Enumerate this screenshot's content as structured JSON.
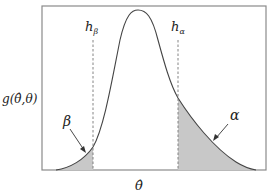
{
  "diagram": {
    "type": "probability-density-with-tail-regions",
    "y_axis_label": "g(θ̂,θ)",
    "x_axis_label": "θ̂",
    "thresholds": [
      {
        "name": "h_beta",
        "symbol": "h",
        "subscript": "β"
      },
      {
        "name": "h_alpha",
        "symbol": "h",
        "subscript": "α"
      }
    ],
    "regions": [
      {
        "name": "beta",
        "label": "β",
        "side": "left tail",
        "shaded": true
      },
      {
        "name": "alpha",
        "label": "α",
        "side": "right tail",
        "shaded": true
      }
    ],
    "colors": {
      "frame": "#888888",
      "curve": "#444444",
      "shade": "#c8c8c8",
      "dashed": "#777777",
      "text": "#222222"
    }
  }
}
